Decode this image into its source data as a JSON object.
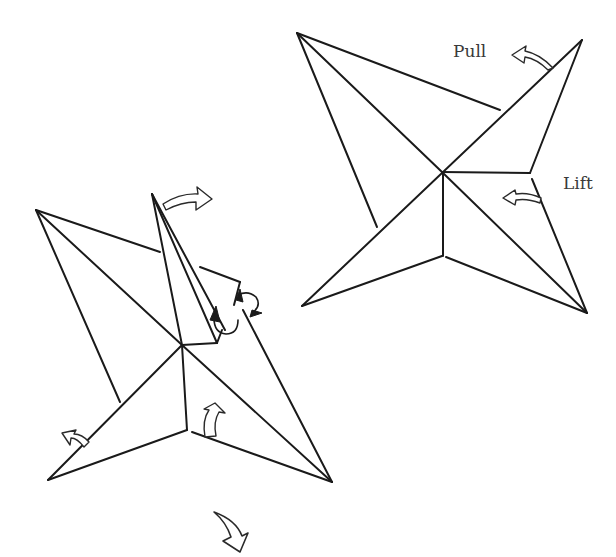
{
  "diagram": {
    "type": "origami-instruction",
    "figures": [
      {
        "id": "figure-right",
        "description": "Four-pointed pinwheel shape with pull and lift arrows",
        "labels": [
          {
            "text": "Pull",
            "x": 453,
            "y": 57
          },
          {
            "text": "Lift",
            "x": 563,
            "y": 189
          }
        ]
      },
      {
        "id": "figure-left",
        "description": "Pinwheel with one point raised and folded; rotation and fold arrows",
        "labels": []
      }
    ],
    "arrows": [
      {
        "name": "pull-arrow",
        "figure": "figure-right"
      },
      {
        "name": "lift-arrow",
        "figure": "figure-right"
      },
      {
        "name": "swing-right-arrow",
        "figure": "figure-left"
      },
      {
        "name": "fold-up-arrow",
        "figure": "figure-left"
      },
      {
        "name": "fold-left-arrow",
        "figure": "figure-left"
      },
      {
        "name": "curl-arrow",
        "figure": "figure-left"
      },
      {
        "name": "next-step-arrow",
        "figure": "figure-left"
      }
    ]
  }
}
